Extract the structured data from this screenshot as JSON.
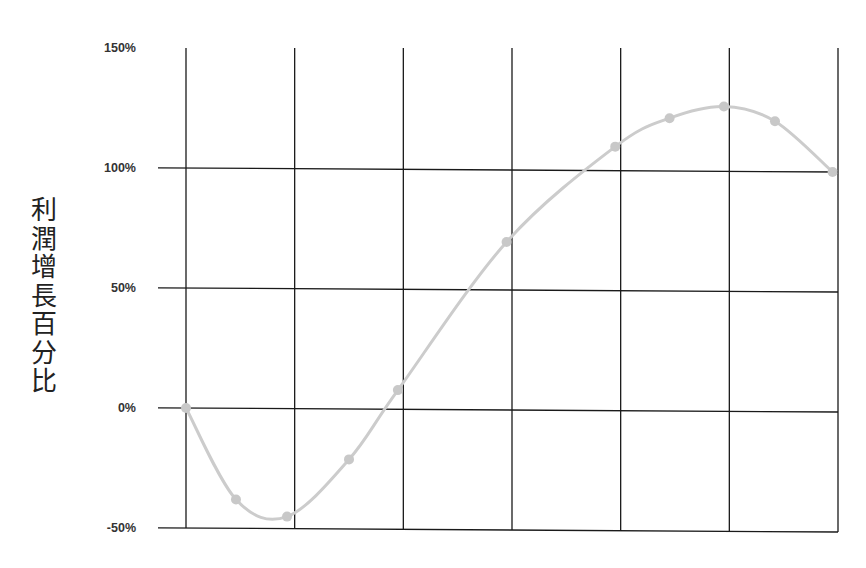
{
  "chart_data": {
    "type": "line",
    "title": "",
    "xlabel": "",
    "ylabel": "利潤增長百分比",
    "ylim": [
      -50,
      150
    ],
    "yticks": [
      "150%",
      "100%",
      "50%",
      "0%",
      "-50%"
    ],
    "ytick_values": [
      150,
      100,
      50,
      0,
      -50
    ],
    "grid": true,
    "legend": null,
    "x_gridlines": 7,
    "series": [
      {
        "name": "profit_growth",
        "color": "#cccccc",
        "smooth": true,
        "x": [
          0,
          0.46,
          0.93,
          1.5,
          1.95,
          2.95,
          3.95,
          4.45,
          4.95,
          5.42,
          5.95
        ],
        "values": [
          0,
          -38,
          -45,
          -21,
          8,
          70,
          110,
          122,
          127,
          121,
          100
        ]
      }
    ]
  },
  "colors": {
    "grid": "#1a1a1a",
    "line": "#cccccc",
    "marker": "#c8c8c8",
    "text": "#333333"
  }
}
